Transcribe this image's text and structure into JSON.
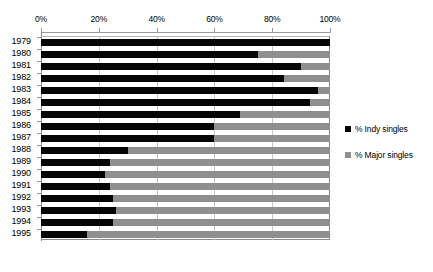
{
  "chart_data": {
    "type": "bar",
    "orientation": "horizontal",
    "stacked": true,
    "stack_mode": "percent",
    "title": "",
    "subtitle": "",
    "xlabel": "",
    "ylabel": "",
    "xlim": [
      0,
      100
    ],
    "xticks": [
      0,
      20,
      40,
      60,
      80,
      100
    ],
    "xtick_labels": [
      "0%",
      "20%",
      "40%",
      "60%",
      "80%",
      "100%"
    ],
    "grid": true,
    "grid_axis": "x",
    "axis_position": "top",
    "legend_position": "right",
    "categories": [
      "1979",
      "1980",
      "1981",
      "1982",
      "1983",
      "1984",
      "1985",
      "1986",
      "1987",
      "1988",
      "1989",
      "1990",
      "1991",
      "1992",
      "1993",
      "1994",
      "1995"
    ],
    "series": [
      {
        "name": "% Indy singles",
        "color": "#050505",
        "values": [
          100,
          75,
          90,
          84,
          96,
          93,
          69,
          60,
          60,
          30,
          24,
          22,
          24,
          25,
          26,
          25,
          16
        ]
      },
      {
        "name": "% Major singles",
        "color": "#8f8f8f",
        "values": [
          0,
          25,
          10,
          16,
          4,
          7,
          31,
          40,
          40,
          70,
          76,
          78,
          76,
          75,
          74,
          75,
          84
        ]
      }
    ]
  },
  "legend": {
    "items": [
      {
        "label": "% Indy singles",
        "swatch": "indy"
      },
      {
        "label": "% Major singles",
        "swatch": "major"
      }
    ]
  },
  "colors": {
    "indy": "#050505",
    "major": "#8f8f8f",
    "grid": "#c9c9c9",
    "axis": "#8a8a8a",
    "background": "#ffffff"
  }
}
